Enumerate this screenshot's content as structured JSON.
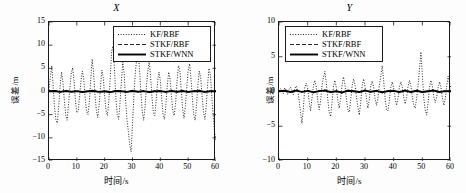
{
  "figure": {
    "background": "#ffffff",
    "axis_color": "#1a1a1a"
  },
  "panels": [
    {
      "id": "panel-x",
      "title": "X",
      "legend_position": "top-right"
    },
    {
      "id": "panel-y",
      "title": "Y",
      "legend_position": "top-left"
    }
  ],
  "legend_entries": [
    {
      "label": "KF/RBF",
      "style": "dotted"
    },
    {
      "label": "STKF/RBF",
      "style": "dashed"
    },
    {
      "label": "STKF/WNN",
      "style": "solid"
    }
  ],
  "chart_data": [
    {
      "type": "line",
      "title": "X",
      "xlabel": "时间/s",
      "ylabel": "误差/m",
      "xlim": [
        0,
        60
      ],
      "ylim": [
        -15,
        15
      ],
      "xticks": [
        0,
        10,
        20,
        30,
        40,
        50,
        60
      ],
      "yticks": [
        -15,
        -10,
        -5,
        0,
        5,
        10,
        15
      ],
      "grid": false,
      "legend_position": "upper right",
      "series": [
        {
          "name": "KF/RBF",
          "style": "dotted",
          "color": "#000000",
          "x": [
            0,
            0.5,
            1,
            1.5,
            2,
            2.5,
            3,
            3.5,
            4,
            4.5,
            5,
            5.5,
            6,
            6.5,
            7,
            7.5,
            8,
            8.5,
            9,
            9.5,
            10,
            10.5,
            11,
            11.5,
            12,
            12.5,
            13,
            13.5,
            14,
            14.5,
            15,
            15.5,
            16,
            16.5,
            17,
            17.5,
            18,
            18.5,
            19,
            19.5,
            20,
            20.5,
            21,
            21.5,
            22,
            22.5,
            23,
            23.5,
            24,
            24.5,
            25,
            25.5,
            26,
            26.5,
            27,
            27.5,
            28,
            28.5,
            29,
            29.5,
            30,
            30.5,
            31,
            31.5,
            32,
            32.5,
            33,
            33.5,
            34,
            34.5,
            35,
            35.5,
            36,
            36.5,
            37,
            37.5,
            38,
            38.5,
            39,
            39.5,
            40,
            40.5,
            41,
            41.5,
            42,
            42.5,
            43,
            43.5,
            44,
            44.5,
            45,
            45.5,
            46,
            46.5,
            47,
            47.5,
            48,
            48.5,
            49,
            49.5,
            50,
            50.5,
            51,
            51.5,
            52,
            52.5,
            53,
            53.5,
            54,
            54.5,
            55,
            55.5,
            56,
            56.5,
            57,
            57.5,
            58,
            58.5,
            59,
            59.5,
            60
          ],
          "y": [
            0.3,
            3.2,
            5.6,
            1.1,
            -3.4,
            -6.2,
            -6.8,
            -3.1,
            1.2,
            4.2,
            2.0,
            -1.8,
            -5.0,
            -6.2,
            -3.0,
            0.8,
            4.0,
            5.1,
            2.2,
            -2.0,
            -4.6,
            -4.2,
            -1.0,
            2.4,
            4.4,
            2.6,
            -1.4,
            -4.3,
            -5.0,
            -2.2,
            2.6,
            7.0,
            4.2,
            -0.5,
            -4.0,
            -5.6,
            -3.0,
            1.0,
            4.6,
            3.0,
            -1.0,
            -4.2,
            -5.2,
            -2.0,
            3.0,
            8.6,
            9.8,
            5.0,
            -1.0,
            -5.0,
            -6.0,
            -2.6,
            2.2,
            6.4,
            4.0,
            -1.6,
            -6.0,
            -8.6,
            -11.5,
            -13.0,
            -7.0,
            -1.0,
            4.0,
            7.0,
            8.6,
            5.0,
            0.0,
            -4.2,
            -6.2,
            -3.4,
            1.0,
            4.4,
            6.6,
            3.2,
            -1.2,
            -4.6,
            -5.2,
            -2.0,
            2.0,
            4.2,
            2.4,
            -1.6,
            -5.0,
            -6.0,
            -3.0,
            1.2,
            4.2,
            2.6,
            -1.0,
            -4.2,
            -5.2,
            -2.4,
            2.0,
            5.6,
            4.8,
            0.5,
            -3.6,
            -5.8,
            -3.2,
            1.0,
            4.6,
            6.0,
            3.0,
            -1.4,
            -5.0,
            -6.2,
            -3.0,
            1.4,
            4.4,
            3.0,
            -1.0,
            -4.4,
            -6.0,
            -3.2,
            1.6,
            5.0,
            3.4,
            -1.2,
            -5.2,
            -8.8,
            -10.6,
            -5.6,
            0.6,
            4.6,
            6.2,
            3.0,
            -1.0,
            -4.0,
            -2.0,
            1.0,
            3.2,
            2.0,
            0.5
          ]
        },
        {
          "name": "STKF/RBF",
          "style": "dashed",
          "color": "#000000",
          "x": [
            0,
            2,
            4,
            6,
            8,
            10,
            12,
            14,
            16,
            18,
            20,
            22,
            24,
            26,
            28,
            30,
            32,
            34,
            36,
            38,
            40,
            42,
            44,
            46,
            48,
            50,
            52,
            54,
            56,
            58,
            60
          ],
          "y": [
            0.1,
            0.25,
            -0.2,
            0.3,
            -0.15,
            0.2,
            -0.25,
            0.15,
            0.3,
            -0.2,
            0.1,
            -0.3,
            0.25,
            0.1,
            -0.2,
            0.3,
            -0.1,
            0.2,
            -0.25,
            0.15,
            0.2,
            -0.2,
            0.3,
            -0.15,
            0.25,
            -0.2,
            0.1,
            0.3,
            -0.2,
            0.15,
            0.1
          ]
        },
        {
          "name": "STKF/WNN",
          "style": "solid",
          "color": "#000000",
          "x": [
            0,
            2,
            4,
            6,
            8,
            10,
            12,
            14,
            16,
            18,
            20,
            22,
            24,
            26,
            28,
            30,
            32,
            34,
            36,
            38,
            40,
            42,
            44,
            46,
            48,
            50,
            52,
            54,
            56,
            58,
            60
          ],
          "y": [
            0.05,
            0.1,
            -0.08,
            0.12,
            -0.05,
            0.08,
            -0.1,
            0.06,
            0.12,
            -0.08,
            0.05,
            -0.12,
            0.1,
            0.04,
            -0.08,
            0.12,
            -0.05,
            0.08,
            -0.1,
            0.06,
            0.08,
            -0.08,
            0.12,
            -0.06,
            0.1,
            -0.08,
            0.05,
            0.12,
            -0.08,
            0.06,
            0.05
          ]
        }
      ]
    },
    {
      "type": "line",
      "title": "Y",
      "xlabel": "时间/s",
      "ylabel": "误差/m",
      "xlim": [
        0,
        60
      ],
      "ylim": [
        -10,
        10
      ],
      "xticks": [
        0,
        10,
        20,
        30,
        40,
        50,
        60
      ],
      "yticks": [
        -10,
        -5,
        0,
        5,
        10
      ],
      "grid": false,
      "legend_position": "upper left",
      "series": [
        {
          "name": "KF/RBF",
          "style": "dotted",
          "color": "#000000",
          "x": [
            0,
            0.5,
            1,
            1.5,
            2,
            2.5,
            3,
            3.5,
            4,
            4.5,
            5,
            5.5,
            6,
            6.5,
            7,
            7.5,
            8,
            8.5,
            9,
            9.5,
            10,
            10.5,
            11,
            11.5,
            12,
            12.5,
            13,
            13.5,
            14,
            14.5,
            15,
            15.5,
            16,
            16.5,
            17,
            17.5,
            18,
            18.5,
            19,
            19.5,
            20,
            20.5,
            21,
            21.5,
            22,
            22.5,
            23,
            23.5,
            24,
            24.5,
            25,
            25.5,
            26,
            26.5,
            27,
            27.5,
            28,
            28.5,
            29,
            29.5,
            30,
            30.5,
            31,
            31.5,
            32,
            32.5,
            33,
            33.5,
            34,
            34.5,
            35,
            35.5,
            36,
            36.5,
            37,
            37.5,
            38,
            38.5,
            39,
            39.5,
            40,
            40.5,
            41,
            41.5,
            42,
            42.5,
            43,
            43.5,
            44,
            44.5,
            45,
            45.5,
            46,
            46.5,
            47,
            47.5,
            48,
            48.5,
            49,
            49.5,
            50,
            50.5,
            51,
            51.5,
            52,
            52.5,
            53,
            53.5,
            54,
            54.5,
            55,
            55.5,
            56,
            56.5,
            57,
            57.5,
            58,
            58.5,
            59,
            59.5,
            60
          ],
          "y": [
            0.1,
            0.4,
            0.2,
            -0.3,
            0.5,
            0.2,
            -0.4,
            0.3,
            0.6,
            0.2,
            -0.5,
            0.4,
            0.8,
            0.3,
            -1.2,
            -3.0,
            -4.6,
            -2.4,
            0.6,
            1.2,
            0.4,
            -1.4,
            -2.8,
            -1.0,
            0.8,
            1.6,
            0.6,
            -1.2,
            -2.6,
            -1.4,
            0.8,
            2.0,
            2.9,
            1.2,
            -1.0,
            -3.0,
            -3.6,
            -1.6,
            0.8,
            1.6,
            0.6,
            -1.2,
            -2.4,
            -1.0,
            0.9,
            2.1,
            1.0,
            -1.0,
            -2.6,
            -3.0,
            -1.2,
            0.8,
            1.8,
            1.0,
            -0.8,
            -2.2,
            -3.4,
            -1.6,
            0.8,
            1.8,
            0.8,
            -1.0,
            -2.4,
            -1.2,
            0.8,
            1.5,
            0.7,
            -1.0,
            -2.0,
            -1.0,
            0.9,
            2.2,
            3.7,
            1.6,
            -1.0,
            -2.6,
            -2.8,
            -1.2,
            0.6,
            1.4,
            0.5,
            -0.9,
            -2.0,
            -1.0,
            0.7,
            1.4,
            0.6,
            -0.8,
            -1.8,
            -0.9,
            0.7,
            1.6,
            0.8,
            -0.8,
            -2.0,
            -2.4,
            -1.0,
            0.8,
            3.2,
            5.7,
            2.4,
            -1.0,
            -2.6,
            -3.4,
            -1.6,
            0.6,
            1.6,
            0.7,
            -0.8,
            -1.6,
            -0.8,
            0.6,
            1.4,
            0.6,
            -0.9,
            -2.0,
            -1.0,
            0.8,
            2.2,
            1.2,
            0.4,
            0.8,
            0.5
          ]
        },
        {
          "name": "STKF/RBF",
          "style": "dashed",
          "color": "#000000",
          "x": [
            0,
            2,
            4,
            6,
            8,
            10,
            12,
            14,
            16,
            18,
            20,
            22,
            24,
            26,
            28,
            30,
            32,
            34,
            36,
            38,
            40,
            42,
            44,
            46,
            48,
            50,
            52,
            54,
            56,
            58,
            60
          ],
          "y": [
            0.08,
            0.2,
            -0.15,
            0.25,
            -0.1,
            0.18,
            -0.2,
            0.12,
            0.25,
            -0.15,
            0.08,
            -0.25,
            0.2,
            0.08,
            -0.15,
            0.25,
            -0.08,
            0.18,
            -0.2,
            0.12,
            0.18,
            -0.15,
            0.25,
            -0.12,
            0.2,
            -0.15,
            0.08,
            0.25,
            -0.15,
            0.12,
            0.08
          ]
        },
        {
          "name": "STKF/WNN",
          "style": "solid",
          "color": "#000000",
          "x": [
            0,
            2,
            4,
            6,
            8,
            10,
            12,
            14,
            16,
            18,
            20,
            22,
            24,
            26,
            28,
            30,
            32,
            34,
            36,
            38,
            40,
            42,
            44,
            46,
            48,
            50,
            52,
            54,
            56,
            58,
            60
          ],
          "y": [
            0.04,
            0.1,
            -0.07,
            0.12,
            -0.05,
            0.09,
            -0.1,
            0.06,
            0.12,
            -0.07,
            0.04,
            -0.12,
            0.1,
            0.04,
            -0.07,
            0.12,
            -0.04,
            0.09,
            -0.1,
            0.06,
            0.09,
            -0.07,
            0.12,
            -0.06,
            0.1,
            -0.07,
            0.04,
            0.12,
            -0.07,
            0.06,
            0.04
          ]
        }
      ]
    }
  ]
}
